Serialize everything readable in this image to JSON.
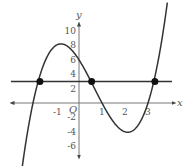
{
  "chart_data": {
    "type": "line",
    "title": "",
    "xlabel": "x",
    "ylabel": "y",
    "origin_label": "O",
    "xlim": [
      -3.4,
      4.0
    ],
    "ylim": [
      -7.5,
      11.5
    ],
    "x_ticks": [
      -1,
      1,
      2,
      3
    ],
    "x_tick_labels": [
      "-1",
      "1",
      "2",
      "3"
    ],
    "y_ticks": [
      10,
      8,
      6,
      4,
      2,
      -2,
      -4,
      -6
    ],
    "y_tick_labels": [
      "10",
      "8",
      "6",
      "4",
      "2",
      "-2",
      "-4",
      "-6"
    ],
    "grid": false,
    "series": [
      {
        "name": "cubic f(x) = (x+2)(x-1)(x-3)",
        "kind": "curve",
        "x_range": [
          -2.5,
          3.85
        ],
        "roots": [
          -2,
          1,
          3
        ],
        "y_intercept": 6,
        "local_max": [
          -0.75,
          8.2
        ],
        "local_min": [
          2.1,
          -4.1
        ]
      },
      {
        "name": "horizontal line y = 3",
        "kind": "line",
        "y": 3
      }
    ],
    "intersection_points": [
      {
        "x": -1.7,
        "y": 3
      },
      {
        "x": 0.55,
        "y": 3
      },
      {
        "x": 3.3,
        "y": 3
      }
    ]
  }
}
